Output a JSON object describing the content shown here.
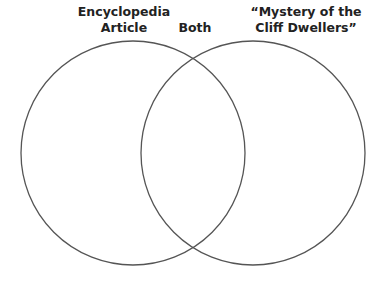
{
  "diagram": {
    "type": "venn",
    "labels": {
      "left_line1": "Encyclopedia",
      "left_line2": "Article",
      "both": "Both",
      "right_line1": "“Mystery of the",
      "right_line2": "Cliff Dwellers”"
    },
    "circles": [
      {
        "name": "Encyclopedia Article",
        "cx": 133,
        "cy": 153,
        "r": 112
      },
      {
        "name": "Mystery of the Cliff Dwellers",
        "cx": 253,
        "cy": 153,
        "r": 112
      }
    ],
    "stroke_color": "#555555"
  }
}
